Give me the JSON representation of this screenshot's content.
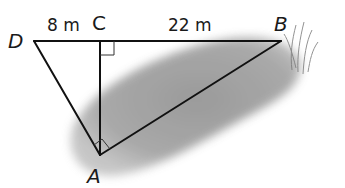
{
  "diagram": {
    "type": "right-triangle geometry figure",
    "points": {
      "D": {
        "label": "D",
        "x": 34,
        "y": 41
      },
      "C": {
        "label": "C",
        "x": 100,
        "y": 41
      },
      "B": {
        "label": "B",
        "x": 281,
        "y": 41
      },
      "A": {
        "label": "A",
        "x": 100,
        "y": 155
      }
    },
    "measurements": {
      "DC": "8 m",
      "CB": "22 m"
    },
    "right_angles": [
      "C",
      "A"
    ],
    "segments": [
      "DB",
      "DA",
      "CA",
      "AB"
    ],
    "background": "gray shaded pond/marsh region with grass at B",
    "colors": {
      "line": "#111111",
      "shade": "#8c8c8c",
      "background": "#ffffff"
    }
  }
}
